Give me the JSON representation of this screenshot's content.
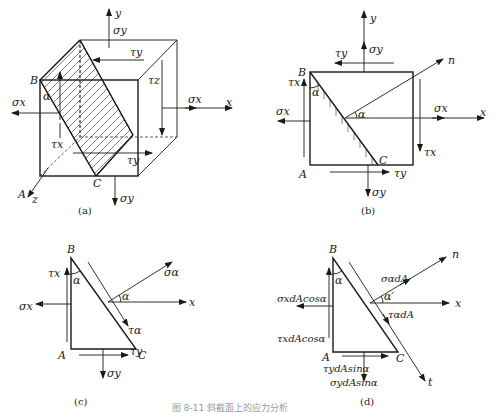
{
  "figure": {
    "caption": "图 8-11  斜截面上的应力分析",
    "panels": {
      "a": {
        "label": "(a)",
        "axes": {
          "x": "x",
          "y": "y",
          "z": "z"
        },
        "points": {
          "A": "A",
          "B": "B",
          "C": "C",
          "alpha": "α"
        },
        "stresses": {
          "sigma_x_left": "σx",
          "sigma_x_right": "σx",
          "sigma_y_top": "σy",
          "sigma_y_bottom": "σy",
          "tau_y_top": "τy",
          "tau_y_bottom": "τy",
          "tau_x": "τx",
          "tau_z": "τz"
        }
      },
      "b": {
        "label": "(b)",
        "axes": {
          "x": "x",
          "y": "y",
          "n": "n"
        },
        "points": {
          "A": "A",
          "B": "B",
          "C": "C",
          "alpha_corner": "α",
          "alpha_normal": "α"
        },
        "stresses": {
          "sigma_x_left": "σx",
          "sigma_x_right": "σx",
          "sigma_y_top": "σy",
          "sigma_y_bottom": "σy",
          "tau_y_top": "τy",
          "tau_y_bottom": "τy",
          "tau_x_left": "τx",
          "tau_x_right": "τx"
        }
      },
      "c": {
        "label": "(c)",
        "axes": {
          "x": "x"
        },
        "points": {
          "A": "A",
          "B": "B",
          "C": "C",
          "alpha_corner": "α",
          "alpha_normal": "α"
        },
        "stresses": {
          "sigma_x": "σx",
          "tau_x": "τx",
          "sigma_y": "σy",
          "tau_y": "τy",
          "sigma_alpha": "σα",
          "tau_alpha": "τα"
        }
      },
      "d": {
        "label": "(d)",
        "axes": {
          "x": "x",
          "n": "n",
          "t": "t"
        },
        "points": {
          "A": "A",
          "B": "B",
          "C": "C",
          "alpha_corner": "α",
          "alpha_normal": "α′"
        },
        "forces": {
          "sigma_x": "σxdAcosα",
          "tau_x": "τxdAcosα",
          "tau_y": "τydAsinα",
          "sigma_y": "σydAsinα",
          "sigma_alpha": "σαdA",
          "tau_alpha": "ταdA"
        }
      }
    }
  }
}
